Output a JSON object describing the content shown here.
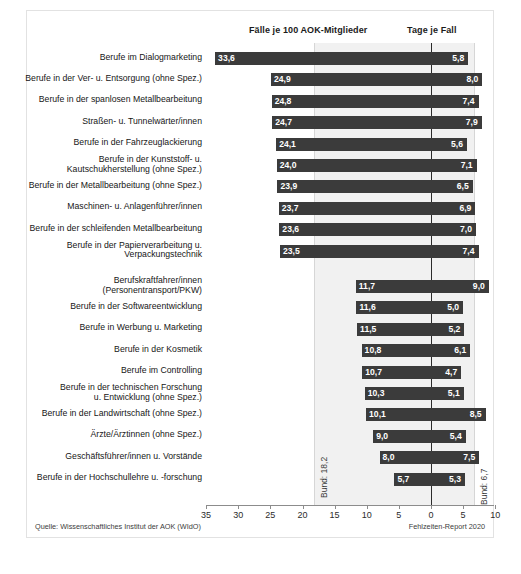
{
  "figure": {
    "header_left": "Fälle je 100 AOK-Mitglieder",
    "header_right": "Tage je Fall",
    "source": "Quelle: Wissenschaftliches Institut der AOK (WIdO)",
    "report": "Fehlzeiten-Report 2020",
    "bund_left_label": "Bund: 18,2",
    "bund_right_label": "Bund: 6,7",
    "bar_color": "#3b3b3b",
    "band_color": "#f1f1f1",
    "zero_line_color": "#2b2b2b"
  },
  "chart_data": {
    "type": "bar",
    "title": "",
    "subtitle": "",
    "orientation": "horizontal-diverging",
    "xlabel": "",
    "ylabel": "",
    "grid": false,
    "legend_position": "none",
    "axis_ticks": [
      35,
      30,
      25,
      20,
      15,
      10,
      5,
      0,
      5,
      10
    ],
    "axis_tick_labels": [
      "35",
      "30",
      "25",
      "20",
      "15",
      "10",
      "5",
      "0",
      "5",
      "10"
    ],
    "left_axis_range": [
      0,
      35
    ],
    "right_axis_range": [
      0,
      10
    ],
    "series": [
      {
        "name": "Fälle je 100 AOK-Mitglieder",
        "direction": "left"
      },
      {
        "name": "Tage je Fall",
        "direction": "right"
      }
    ],
    "reference_lines": [
      {
        "label": "Bund: 18,2",
        "value": 18.2,
        "side": "left"
      },
      {
        "label": "Bund: 6,7",
        "value": 6.7,
        "side": "right"
      }
    ],
    "categories": [
      "Berufe im Dialogmarketing",
      "Berufe in der Ver- u. Entsorgung (ohne Spez.)",
      "Berufe in der spanlosen Metallbearbeitung",
      "Straßen- u. Tunnelwärter/innen",
      "Berufe in der Fahrzeuglackierung",
      "Berufe in der Kunststoff- u. Kautschukherstellung (ohne Spez.)",
      "Berufe in der Metallbearbeitung (ohne Spez.)",
      "Maschinen- u. Anlagenführer/innen",
      "Berufe in der schleifenden Metallbearbeitung",
      "Berufe in der Papierverarbeitung u. Verpackungstechnik",
      "Berufskraftfahrer/innen (Personentransport/PKW)",
      "Berufe in der Softwareentwicklung",
      "Berufe in Werbung u. Marketing",
      "Berufe in der Kosmetik",
      "Berufe im Controlling",
      "Berufe in der technischen Forschung u. Entwicklung (ohne Spez.)",
      "Berufe in der Landwirtschaft (ohne Spez.)",
      "Ärzte/Ärztinnen (ohne Spez.)",
      "Geschäftsführer/innen u. Vorstände",
      "Berufe in der Hochschullehre u. -forschung"
    ],
    "cases_per_100": [
      33.6,
      24.9,
      24.8,
      24.7,
      24.1,
      24.0,
      23.9,
      23.7,
      23.6,
      23.5,
      11.7,
      11.6,
      11.5,
      10.8,
      10.7,
      10.3,
      10.1,
      9.0,
      8.0,
      5.7
    ],
    "days_per_case": [
      5.8,
      8.0,
      7.4,
      7.9,
      5.6,
      7.1,
      6.5,
      6.9,
      7.0,
      7.4,
      9.0,
      5.0,
      5.2,
      6.1,
      4.7,
      5.1,
      8.5,
      5.4,
      7.5,
      5.3
    ]
  },
  "rows": [
    {
      "label_lines": [
        "Berufe im Dialogmarketing"
      ],
      "left": "33,6",
      "right": "5,8"
    },
    {
      "label_lines": [
        "Berufe in der Ver- u. Entsorgung (ohne Spez.)"
      ],
      "left": "24,9",
      "right": "8,0"
    },
    {
      "label_lines": [
        "Berufe in der spanlosen Metallbearbeitung"
      ],
      "left": "24,8",
      "right": "7,4"
    },
    {
      "label_lines": [
        "Straßen- u. Tunnelwärter/innen"
      ],
      "left": "24,7",
      "right": "7,9"
    },
    {
      "label_lines": [
        "Berufe in der Fahrzeuglackierung"
      ],
      "left": "24,1",
      "right": "5,6"
    },
    {
      "label_lines": [
        "Berufe in der Kunststoff- u.",
        "Kautschukherstellung (ohne Spez.)"
      ],
      "left": "24,0",
      "right": "7,1"
    },
    {
      "label_lines": [
        "Berufe in der Metallbearbeitung (ohne Spez.)"
      ],
      "left": "23,9",
      "right": "6,5"
    },
    {
      "label_lines": [
        "Maschinen- u. Anlagenführer/innen"
      ],
      "left": "23,7",
      "right": "6,9"
    },
    {
      "label_lines": [
        "Berufe in der schleifenden Metallbearbeitung"
      ],
      "left": "23,6",
      "right": "7,0"
    },
    {
      "label_lines": [
        "Berufe in der Papierverarbeitung u.",
        "Verpackungstechnik"
      ],
      "left": "23,5",
      "right": "7,4"
    },
    {
      "label_lines": [
        "Berufskraftfahrer/innen",
        "(Personentransport/PKW)"
      ],
      "left": "11,7",
      "right": "9,0"
    },
    {
      "label_lines": [
        "Berufe in der Softwareentwicklung"
      ],
      "left": "11,6",
      "right": "5,0"
    },
    {
      "label_lines": [
        "Berufe in Werbung u. Marketing"
      ],
      "left": "11,5",
      "right": "5,2"
    },
    {
      "label_lines": [
        "Berufe in der Kosmetik"
      ],
      "left": "10,8",
      "right": "6,1"
    },
    {
      "label_lines": [
        "Berufe im Controlling"
      ],
      "left": "10,7",
      "right": "4,7"
    },
    {
      "label_lines": [
        "Berufe in der technischen Forschung",
        "u. Entwicklung (ohne Spez.)"
      ],
      "left": "10,3",
      "right": "5,1"
    },
    {
      "label_lines": [
        "Berufe in der Landwirtschaft (ohne Spez.)"
      ],
      "left": "10,1",
      "right": "8,5"
    },
    {
      "label_lines": [
        "Ärzte/Ärztinnen (ohne Spez.)"
      ],
      "left": "9,0",
      "right": "5,4"
    },
    {
      "label_lines": [
        "Geschäftsführer/innen u. Vorstände"
      ],
      "left": "8,0",
      "right": "7,5"
    },
    {
      "label_lines": [
        "Berufe in der Hochschullehre u. -forschung"
      ],
      "left": "5,7",
      "right": "5,3"
    }
  ]
}
